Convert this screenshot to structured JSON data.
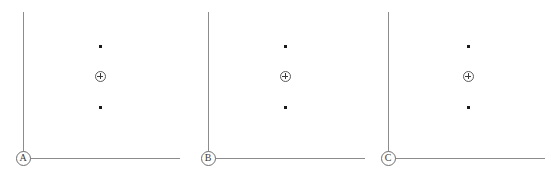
{
  "figure": {
    "width": 551,
    "height": 177,
    "background_color": "#ffffff",
    "axis_color": "#8c8c8c",
    "marker_color": "#1a1a1a",
    "label_color": "#3a3a3a"
  },
  "panels": [
    {
      "label": "A",
      "label_name": "origin-label-a",
      "offset_x": 0,
      "axis_v_x": 23,
      "axis_v_top": 12,
      "axis_v_bottom": 158,
      "axis_h_y": 158,
      "axis_h_left": 23,
      "axis_h_right": 180,
      "origin_x": 23,
      "origin_y": 158,
      "markers": [
        {
          "type": "dot",
          "x": 100,
          "y": 46
        },
        {
          "type": "circled-plus",
          "x": 100,
          "y": 76
        },
        {
          "type": "dot",
          "x": 100,
          "y": 107
        }
      ]
    },
    {
      "label": "B",
      "label_name": "origin-label-b",
      "offset_x": 185,
      "axis_v_x": 208,
      "axis_v_top": 12,
      "axis_v_bottom": 158,
      "axis_h_y": 158,
      "axis_h_left": 208,
      "axis_h_right": 365,
      "origin_x": 208,
      "origin_y": 158,
      "markers": [
        {
          "type": "dot",
          "x": 285,
          "y": 46
        },
        {
          "type": "circled-plus",
          "x": 285,
          "y": 76
        },
        {
          "type": "dot",
          "x": 285,
          "y": 107
        }
      ]
    },
    {
      "label": "C",
      "label_name": "origin-label-c",
      "offset_x": 366,
      "axis_v_x": 388,
      "axis_v_top": 12,
      "axis_v_bottom": 158,
      "axis_h_y": 158,
      "axis_h_left": 388,
      "axis_h_right": 545,
      "origin_x": 388,
      "origin_y": 158,
      "markers": [
        {
          "type": "dot",
          "x": 468,
          "y": 46
        },
        {
          "type": "circled-plus",
          "x": 468,
          "y": 76
        },
        {
          "type": "dot",
          "x": 468,
          "y": 107
        }
      ]
    }
  ]
}
